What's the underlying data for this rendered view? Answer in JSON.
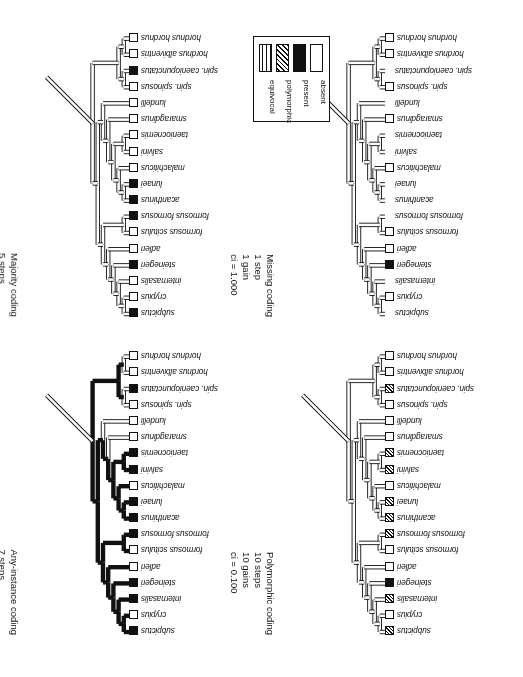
{
  "figure": {
    "legend": {
      "title": "character state legend",
      "items": [
        {
          "label": "absent",
          "swatch": "absent"
        },
        {
          "label": "present",
          "swatch": "present"
        },
        {
          "label": "polymorphic",
          "swatch": "polymorphic"
        },
        {
          "label": "equivocal",
          "swatch": "equivocal"
        }
      ]
    },
    "taxa": [
      "subpictus",
      "crypius",
      "internasalis",
      "steinegeri",
      "adleri",
      "formosus scitulus",
      "formosus formosus",
      "acanthinus",
      "lunaei",
      "malachiticus",
      "salvini",
      "taeniocnemis",
      "smaragdinus",
      "lundelli",
      "spin. spinosus",
      "spin. caeniopunctatus",
      "hordnus albiventris",
      "hordnus hordnus"
    ],
    "panels": [
      {
        "id": "majority",
        "title": "Majority coding",
        "steps": "5 steps",
        "changes": "5 gains",
        "ci": "ci = 0.20",
        "states": [
          "present",
          "absent",
          "absent",
          "present",
          "absent",
          "absent",
          "present",
          "present",
          "present",
          "absent",
          "absent",
          "absent",
          "absent",
          "absent",
          "absent",
          "present",
          "absent",
          "absent"
        ],
        "branch_states": [
          "absent",
          "absent",
          "absent",
          "absent",
          "absent",
          "absent",
          "absent",
          "absent",
          "absent",
          "absent",
          "absent",
          "absent",
          "absent",
          "absent",
          "absent",
          "absent",
          "absent"
        ]
      },
      {
        "id": "missing",
        "title": "Missing coding",
        "steps": "1 step",
        "changes": "1 gain",
        "ci": "ci = 1.000",
        "states": [
          "none",
          "absent",
          "none",
          "present",
          "absent",
          "absent",
          "none",
          "none",
          "none",
          "absent",
          "none",
          "none",
          "absent",
          "none",
          "absent",
          "none",
          "absent",
          "absent"
        ],
        "branch_states": [
          "absent",
          "absent",
          "absent",
          "absent",
          "absent",
          "absent",
          "absent",
          "absent",
          "absent",
          "absent",
          "absent",
          "absent",
          "absent",
          "absent",
          "absent",
          "absent",
          "absent"
        ]
      },
      {
        "id": "anyinstance",
        "title": "Any-instance coding",
        "steps": "7 steps",
        "changes": "1 gain, 6 losses",
        "ci": "ci = 0.143",
        "states": [
          "present",
          "absent",
          "present",
          "present",
          "absent",
          "absent",
          "present",
          "present",
          "present",
          "absent",
          "present",
          "present",
          "absent",
          "absent",
          "absent",
          "present",
          "absent",
          "absent"
        ],
        "branch_states": [
          "present",
          "present",
          "present",
          "present",
          "present",
          "present",
          "present",
          "present",
          "present",
          "present",
          "present",
          "present",
          "absent",
          "absent",
          "absent",
          "absent",
          "absent"
        ]
      },
      {
        "id": "polymorphic",
        "title": "Polymorphic coding",
        "steps": "10 steps",
        "changes": "10 gains",
        "ci": "ci = 0.100",
        "states": [
          "polymorphic",
          "absent",
          "polymorphic",
          "present",
          "absent",
          "absent",
          "polymorphic",
          "polymorphic",
          "polymorphic",
          "absent",
          "polymorphic",
          "polymorphic",
          "absent",
          "absent",
          "absent",
          "polymorphic",
          "absent",
          "absent"
        ],
        "branch_states": [
          "absent",
          "absent",
          "absent",
          "absent",
          "absent",
          "absent",
          "absent",
          "absent",
          "absent",
          "absent",
          "absent",
          "absent",
          "absent",
          "absent",
          "absent",
          "absent",
          "absent"
        ]
      }
    ]
  },
  "colors": {
    "ink": "#111111",
    "paper": "#ffffff"
  }
}
